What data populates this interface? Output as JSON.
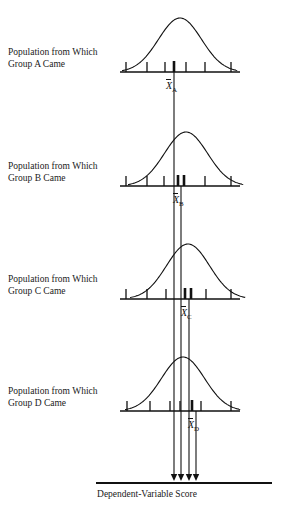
{
  "figure": {
    "title_caption": "Dependent-Variable Score",
    "stroke_color": "#111111",
    "background_color": "#ffffff"
  },
  "panels": [
    {
      "id": "A",
      "label": "Population from Which\nGroup A Came",
      "mean_label_prefix": "X",
      "mean_label_subscript": "A",
      "baseline_y": 72,
      "curve_peak_y": 18,
      "curve_center_x": 180,
      "curve_halfwidth": 58,
      "mean_x": 174,
      "label_y": 58,
      "mean_label_x": 166,
      "mean_label_y": 80,
      "ticks": [
        {
          "x": 126,
          "bold": false
        },
        {
          "x": 147,
          "bold": false
        },
        {
          "x": 165,
          "bold": false
        },
        {
          "x": 174,
          "bold": true
        },
        {
          "x": 186,
          "bold": false
        },
        {
          "x": 205,
          "bold": false
        },
        {
          "x": 231,
          "bold": false
        }
      ]
    },
    {
      "id": "B",
      "label": "Population from Which\nGroup B Came",
      "mean_label_prefix": "X",
      "mean_label_subscript": "B",
      "baseline_y": 186,
      "curve_peak_y": 132,
      "curve_center_x": 186,
      "curve_halfwidth": 58,
      "mean_x": 181,
      "label_y": 172,
      "mean_label_x": 173,
      "mean_label_y": 194,
      "ticks": [
        {
          "x": 126,
          "bold": false
        },
        {
          "x": 147,
          "bold": false
        },
        {
          "x": 164,
          "bold": false
        },
        {
          "x": 178,
          "bold": true
        },
        {
          "x": 184,
          "bold": true
        },
        {
          "x": 205,
          "bold": false
        },
        {
          "x": 231,
          "bold": false
        }
      ]
    },
    {
      "id": "C",
      "label": "Population from Which\nGroup C Came",
      "mean_label_prefix": "X",
      "mean_label_subscript": "C",
      "baseline_y": 299,
      "curve_peak_y": 244,
      "curve_center_x": 188,
      "curve_halfwidth": 58,
      "mean_x": 189,
      "label_y": 285,
      "mean_label_x": 181,
      "mean_label_y": 307,
      "ticks": [
        {
          "x": 126,
          "bold": false
        },
        {
          "x": 147,
          "bold": false
        },
        {
          "x": 166,
          "bold": false
        },
        {
          "x": 185,
          "bold": true
        },
        {
          "x": 191,
          "bold": true
        },
        {
          "x": 206,
          "bold": false
        },
        {
          "x": 231,
          "bold": false
        }
      ]
    },
    {
      "id": "D",
      "label": "Population from Which\nGroup D Came",
      "mean_label_prefix": "X",
      "mean_label_subscript": "D",
      "baseline_y": 411,
      "curve_peak_y": 357,
      "curve_center_x": 183,
      "curve_halfwidth": 58,
      "mean_x": 196,
      "label_y": 397,
      "mean_label_x": 188,
      "mean_label_y": 419,
      "ticks": [
        {
          "x": 127,
          "bold": false
        },
        {
          "x": 150,
          "bold": false
        },
        {
          "x": 170,
          "bold": false
        },
        {
          "x": 180,
          "bold": false
        },
        {
          "x": 192,
          "bold": true
        },
        {
          "x": 201,
          "bold": false
        },
        {
          "x": 231,
          "bold": false
        }
      ]
    }
  ],
  "mean_lines": [
    {
      "group": "A",
      "x": 174,
      "from_y": 72,
      "to_y": 481
    },
    {
      "group": "B",
      "x": 181,
      "from_y": 186,
      "to_y": 481
    },
    {
      "group": "C",
      "x": 189,
      "from_y": 299,
      "to_y": 481
    },
    {
      "group": "D",
      "x": 196,
      "from_y": 411,
      "to_y": 481
    }
  ],
  "bottom_axis": {
    "y": 483,
    "x_start": 96,
    "x_end": 272,
    "caption": "Dependent-Variable Score",
    "caption_y": 489
  },
  "baseline_extent": {
    "x_start": 120,
    "x_end": 240
  }
}
